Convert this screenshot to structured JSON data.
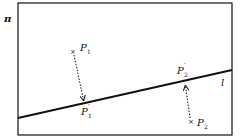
{
  "diagram": {
    "plane": {
      "label": "π",
      "x": 18,
      "y": 3,
      "width": 214,
      "height": 132
    },
    "line": {
      "label": "l",
      "x1": 18,
      "y1": 118,
      "x2": 232,
      "y2": 70
    },
    "points": [
      {
        "name": "P",
        "sub": "1",
        "x": 73,
        "y": 51
      },
      {
        "name": "P",
        "sub": "2",
        "x": 192,
        "y": 120
      }
    ],
    "projections": [
      {
        "name": "P",
        "prime": "′",
        "sub": "1",
        "x": 84,
        "y": 101
      },
      {
        "name": "P",
        "prime": "′",
        "sub": "2",
        "x": 185,
        "y": 85
      }
    ],
    "colors": {
      "stroke": "#111111",
      "background": "#ffffff"
    }
  }
}
